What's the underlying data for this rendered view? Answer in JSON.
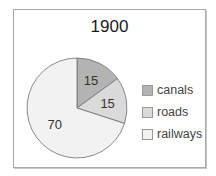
{
  "chart_data": {
    "type": "pie",
    "title": "1900",
    "categories": [
      "canals",
      "roads",
      "railways"
    ],
    "values": [
      15,
      15,
      70
    ],
    "labels": [
      "15",
      "15",
      "70"
    ],
    "colors": [
      "#b3b3b3",
      "#dadada",
      "#f2f2f2"
    ],
    "legend_position": "right"
  },
  "legend": {
    "items": [
      {
        "label": "canals",
        "color": "#b3b3b3"
      },
      {
        "label": "roads",
        "color": "#dadada"
      },
      {
        "label": "railways",
        "color": "#f2f2f2"
      }
    ]
  }
}
